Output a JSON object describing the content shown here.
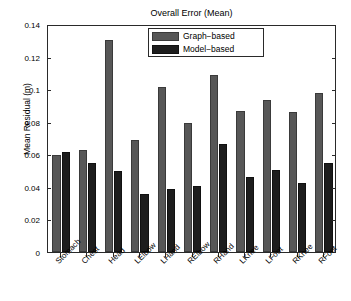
{
  "chart_data": {
    "type": "bar",
    "title": "Overall Error (Mean)",
    "xlabel": "",
    "ylabel": "Mean Residual (m)",
    "ylim": [
      0,
      0.14
    ],
    "ytick_labels": [
      "0",
      "0.02",
      "0.04",
      "0.06",
      "0.08",
      "0.1",
      "0.12",
      "0.14"
    ],
    "ytick_values": [
      0,
      0.02,
      0.04,
      0.06,
      0.08,
      0.1,
      0.12,
      0.14
    ],
    "grid": false,
    "legend_position": "top-center",
    "categories": [
      "Stomach",
      "Chest",
      "Head",
      "LElbow",
      "LHand",
      "RElbow",
      "RHand",
      "LKnee",
      "LFoot",
      "RKnee",
      "RFoot"
    ],
    "series": [
      {
        "name": "Graph−based",
        "color": "#575757",
        "values": [
          0.0595,
          0.0627,
          0.1301,
          0.0686,
          0.1013,
          0.079,
          0.1088,
          0.0866,
          0.0935,
          0.0859,
          0.0976
        ]
      },
      {
        "name": "Model−based",
        "color": "#1d1d1d",
        "values": [
          0.0612,
          0.0546,
          0.0497,
          0.0357,
          0.0388,
          0.0403,
          0.0665,
          0.0462,
          0.0506,
          0.0424,
          0.0549
        ]
      }
    ]
  }
}
